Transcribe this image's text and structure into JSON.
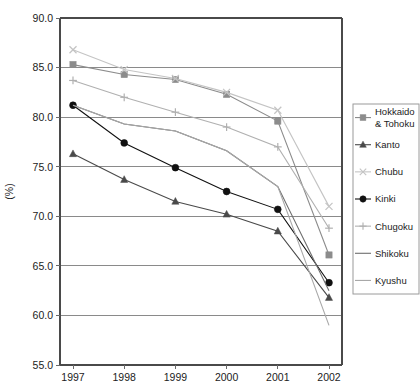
{
  "chart_data": {
    "type": "line",
    "title": "",
    "xlabel": "",
    "ylabel": "(%)",
    "categories": [
      "1997",
      "1998",
      "1999",
      "2000",
      "2001",
      "2002"
    ],
    "x": [
      1997,
      1998,
      1999,
      2000,
      2001,
      2002
    ],
    "ylim": [
      55.0,
      90.0
    ],
    "xlim": [
      1997,
      2002
    ],
    "y_ticks": [
      "55.0",
      "60.0",
      "65.0",
      "70.0",
      "75.0",
      "80.0",
      "85.0",
      "90.0"
    ],
    "y_tick_values": [
      55.0,
      60.0,
      65.0,
      70.0,
      75.0,
      80.0,
      85.0,
      90.0
    ],
    "grid": "horizontal",
    "legend_position": "right",
    "series": [
      {
        "name": "Hokkaido & Tohoku",
        "marker": "square",
        "color": "#8c8c8c",
        "values": [
          85.3,
          84.3,
          83.8,
          82.3,
          79.6,
          66.1
        ]
      },
      {
        "name": "Kanto",
        "marker": "triangle",
        "color": "#4a4a4a",
        "values": [
          76.3,
          73.7,
          71.5,
          70.2,
          68.5,
          61.8
        ]
      },
      {
        "name": "Chubu",
        "marker": "cross-x",
        "color": "#c4c4c4",
        "values": [
          86.8,
          84.8,
          83.9,
          82.5,
          80.7,
          71.0
        ]
      },
      {
        "name": "Kinki",
        "marker": "circle",
        "color": "#111111",
        "values": [
          81.2,
          77.4,
          74.9,
          72.5,
          70.7,
          63.3
        ]
      },
      {
        "name": "Chugoku",
        "marker": "plus",
        "color": "#b0b0b0",
        "values": [
          83.7,
          82.0,
          80.5,
          79.0,
          77.0,
          68.8
        ]
      },
      {
        "name": "Shikoku",
        "marker": "none",
        "color": "#6e6e6e",
        "values": [
          81.2,
          79.3,
          78.6,
          76.6,
          73.0,
          62.5
        ]
      },
      {
        "name": "Kyushu",
        "marker": "none",
        "color": "#a8a8a8",
        "values": [
          81.2,
          79.3,
          78.6,
          76.6,
          73.0,
          59.0
        ]
      }
    ]
  },
  "legend": {
    "entries": [
      {
        "label": "Hokkaido",
        "label2": "& Tohoku"
      },
      {
        "label": "Kanto",
        "label2": ""
      },
      {
        "label": "Chubu",
        "label2": ""
      },
      {
        "label": "Kinki",
        "label2": ""
      },
      {
        "label": "Chugoku",
        "label2": ""
      },
      {
        "label": "Shikoku",
        "label2": ""
      },
      {
        "label": "Kyushu",
        "label2": ""
      }
    ]
  }
}
